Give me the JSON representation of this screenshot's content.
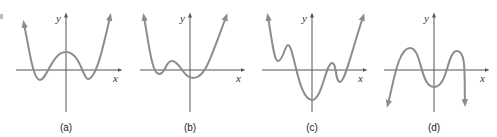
{
  "figure": {
    "colors": {
      "axis": "#555555",
      "curve": "#8c8c8c",
      "text": "#333333"
    },
    "panels": [
      {
        "id": "a",
        "label": "(a)",
        "x_axis_label": "x",
        "y_axis_label": "y",
        "shape": "W-shaped, two minima below x-axis, local max above x-axis at y-axis, both ends up"
      },
      {
        "id": "b",
        "label": "(b)",
        "x_axis_label": "x",
        "y_axis_label": "y",
        "shape": "Small bump left of y-axis, minimum below x-axis right of y-axis, both ends up"
      },
      {
        "id": "c",
        "label": "(c)",
        "x_axis_label": "x",
        "y_axis_label": "y",
        "shape": "Multiple turning points, deep minimum below at y-axis, both ends up"
      },
      {
        "id": "d",
        "label": "(d)",
        "x_axis_label": "x",
        "y_axis_label": "y",
        "shape": "M-shaped, two maxima above x-axis, minimum below at y-axis, both ends down"
      }
    ]
  }
}
